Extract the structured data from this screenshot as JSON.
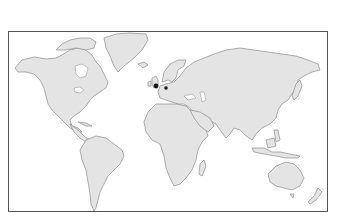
{
  "map": {
    "title": "World map",
    "projection": "equirectangular-style world outline",
    "colors": {
      "land": "#e4e4e4",
      "coastline": "#8c8c8c",
      "frame": "#555555",
      "ocean": "#ffffff",
      "marker": "#1a1a1a"
    },
    "markers": [
      {
        "label": "London",
        "x": 156,
        "y": 86,
        "r": 2.4
      },
      {
        "label": "Western Europe (Netherlands/Germany)",
        "x": 166,
        "y": 88,
        "r": 1.8
      }
    ]
  }
}
